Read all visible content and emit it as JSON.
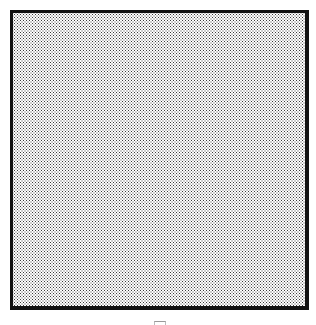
{
  "canvas": {
    "fill_pattern": "dotted",
    "border_color": "#111111",
    "dot_color": "#3a3a3a",
    "background_color": "#ffffff"
  },
  "icons": {
    "bottom_mark": "cropped-glyph-icon"
  }
}
